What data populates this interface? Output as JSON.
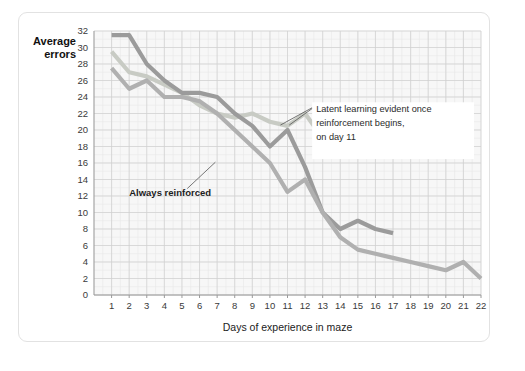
{
  "chart_data": {
    "type": "line",
    "title": "",
    "xlabel": "Days of experience in maze",
    "ylabel": "Average errors",
    "xlim": [
      0,
      22
    ],
    "ylim": [
      0,
      32
    ],
    "y_ticks": [
      0,
      2,
      4,
      6,
      8,
      10,
      12,
      14,
      16,
      18,
      20,
      22,
      24,
      26,
      28,
      30,
      32
    ],
    "x_ticks": [
      1,
      2,
      3,
      4,
      5,
      6,
      7,
      8,
      9,
      10,
      11,
      12,
      13,
      14,
      15,
      16,
      17,
      18,
      19,
      20,
      21,
      22
    ],
    "grid": true,
    "legend_position": "inline-annotations",
    "series": [
      {
        "name": "Never reinforced",
        "color": "#c8cbc4",
        "x": [
          1,
          2,
          3,
          4,
          5,
          6,
          7,
          8,
          9,
          10,
          11,
          12,
          13,
          14,
          15,
          16,
          17
        ],
        "values": [
          29.5,
          27.0,
          26.5,
          25.5,
          24.5,
          23.0,
          22.0,
          21.5,
          22.0,
          21.0,
          20.5,
          22.0,
          19.0,
          20.0,
          18.5,
          20.0,
          18.5
        ]
      },
      {
        "name": "Latent learning group",
        "color": "#9b9b9b",
        "x": [
          1,
          2,
          3,
          4,
          5,
          6,
          7,
          8,
          9,
          10,
          11,
          12,
          13,
          14,
          15,
          16,
          17
        ],
        "values": [
          31.5,
          31.5,
          28.0,
          26.0,
          24.5,
          24.5,
          24.0,
          22.0,
          20.5,
          18.0,
          20.0,
          15.5,
          10.0,
          8.0,
          9.0,
          8.0,
          7.5
        ]
      },
      {
        "name": "Always reinforced",
        "color": "#b0b0b0",
        "x": [
          1,
          2,
          3,
          4,
          5,
          6,
          7,
          8,
          9,
          10,
          11,
          12,
          13,
          14,
          15,
          16,
          17,
          18,
          19,
          20,
          21,
          22
        ],
        "values": [
          27.5,
          25.0,
          26.0,
          24.0,
          24.0,
          23.5,
          22.0,
          20.0,
          18.0,
          16.0,
          12.5,
          14.0,
          10.0,
          7.0,
          5.5,
          5.0,
          4.5,
          4.0,
          3.5,
          3.0,
          4.0,
          2.0
        ]
      }
    ],
    "annotations": [
      {
        "id": "never-reinforced-label",
        "text": "Never reinforced",
        "target_series": "Never reinforced"
      },
      {
        "id": "always-reinforced-label",
        "text": "Always reinforced",
        "target_series": "Always reinforced"
      },
      {
        "id": "latent-learning-note",
        "line1": "Latent learning evident once",
        "line2": "reinforcement begins,",
        "line3": "on day 11",
        "target_series": "Latent learning group"
      }
    ]
  },
  "axes": {
    "y_title_line1": "Average",
    "y_title_line2": "errors",
    "x_title": "Days of experience in maze"
  },
  "colors": {
    "plot_background": "#f7f7f7",
    "grid_minor": "#e8e8e8",
    "grid_major": "#d0d0d0",
    "axis": "#9a9a9a",
    "card_border": "#e2e2e2",
    "text": "#222222"
  }
}
